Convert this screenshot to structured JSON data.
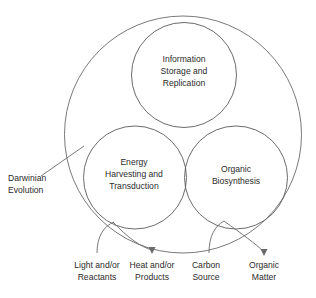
{
  "diagram": {
    "title_text": "",
    "outer_circle": {
      "label_lines": [
        "Darwinian",
        "Evolution"
      ],
      "name": "darwinian-evolution"
    },
    "inner_circles": [
      {
        "id": "information-storage-and-replication",
        "label_lines": [
          "Information",
          "Storage and",
          "Replication"
        ]
      },
      {
        "id": "energy-harvesting-and-transduction",
        "label_lines": [
          "Energy",
          "Harvesting and",
          "Transduction"
        ]
      },
      {
        "id": "organic-biosynthesis",
        "label_lines": [
          "Organic",
          "Biosynthesis"
        ]
      }
    ],
    "flows": [
      {
        "id": "light-and-or-reactants",
        "label_lines": [
          "Light and/or",
          "Reactants"
        ],
        "direction": "input",
        "target": "energy-harvesting-and-transduction"
      },
      {
        "id": "heat-and-or-products",
        "label_lines": [
          "Heat and/or",
          "Products"
        ],
        "direction": "output",
        "source": "energy-harvesting-and-transduction"
      },
      {
        "id": "carbon-source",
        "label_lines": [
          "Carbon",
          "Source"
        ],
        "direction": "input",
        "target": "organic-biosynthesis"
      },
      {
        "id": "organic-matter",
        "label_lines": [
          "Organic",
          "Matter"
        ],
        "direction": "output",
        "source": "organic-biosynthesis"
      }
    ],
    "colors": {
      "stroke": "#5a5a5a",
      "text": "#2b2b2b",
      "background": "#ffffff"
    }
  }
}
